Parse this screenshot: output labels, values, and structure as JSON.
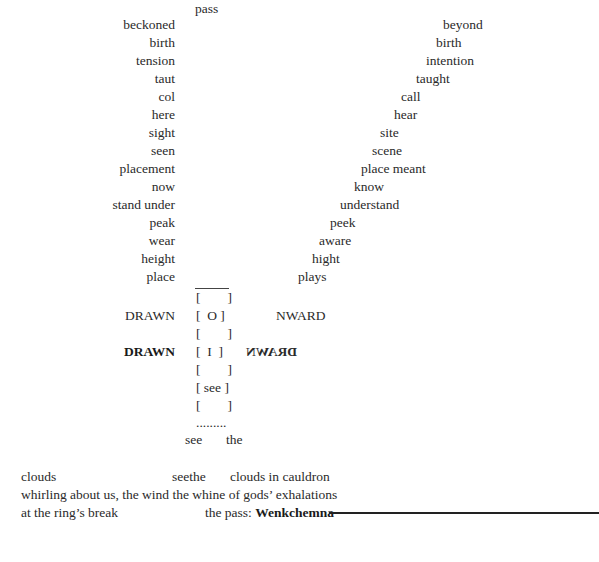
{
  "poem": {
    "top_word": "pass",
    "left_column": [
      "beckoned",
      "birth",
      "tension",
      "taut",
      "col",
      "here",
      "sight",
      "seen",
      "placement",
      "now",
      "stand under",
      "peak",
      "wear",
      "height",
      "place"
    ],
    "right_column": [
      "beyond",
      "birth",
      "intention",
      "taught",
      "call",
      "hear",
      "site",
      "scene",
      "place meant",
      "know",
      "understand",
      "peek",
      "aware",
      "hight",
      "plays"
    ],
    "drawn_rows": {
      "left_1": "DRAWN",
      "right_1": "NWARD",
      "left_2": "DRAWN",
      "right_2_mirrored": "DRAWN"
    },
    "brackets": [
      "[        ]",
      "[  O ]",
      "[        ]",
      "[  I  ]",
      "[        ]",
      "[ see ]",
      "[        ]"
    ],
    "dots": ".........",
    "see_the": {
      "see": "see",
      "the": "the"
    },
    "prose": {
      "line1_a": "clouds",
      "line1_b": "seethe",
      "line1_c": "clouds in cauldron",
      "line2": "whirling about us, the wind the whine of gods’ exhalations",
      "line3_a": "at the ring’s break",
      "line3_b": "the pass: ",
      "line3_bold": "Wenkchemna"
    }
  }
}
